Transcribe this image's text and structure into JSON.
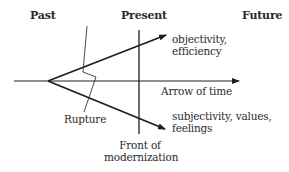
{
  "diagram": {
    "headers": {
      "past": "Past",
      "present": "Present",
      "future": "Future"
    },
    "labels": {
      "upper_branch": "objectivity,\nefficiency",
      "time_axis": "Arrow of time",
      "lower_branch": "subjectivity, values,\nfeelings",
      "rupture": "Rupture",
      "front": "Front of\nmodernization"
    },
    "colors": {
      "line": "#1e1e1e",
      "text": "#2a2a2a",
      "background": "#ffffff"
    }
  }
}
